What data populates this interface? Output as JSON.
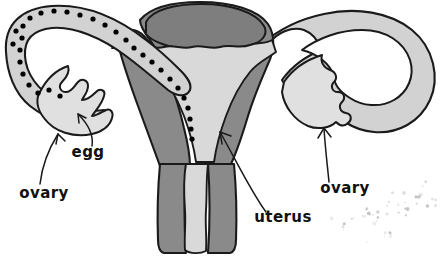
{
  "figure": {
    "title": "Female reproductive system (uterus, fallopian tubes, ovaries)",
    "background_color": "#ffffff",
    "width": 443,
    "height": 259
  },
  "palette": {
    "outline": "#1a1a1a",
    "muscle_dark_gray": "#8a8a8a",
    "dome_gray": "#7e7e7e",
    "cavity_light_gray": "#d9d9d9",
    "tube_light_gray": "#d2d2d2",
    "ovary_pale_gray": "#e0e0e0",
    "egg_dot": "#000000",
    "speckle_gray": "#b0b0b0",
    "label_color": "#111111"
  },
  "labels": [
    {
      "id": "egg",
      "text": "egg",
      "x": 88,
      "y": 157,
      "anchor": "middle",
      "leader": "curved-arrow-up-left"
    },
    {
      "id": "ovary-left",
      "text": "ovary",
      "x": 44,
      "y": 198,
      "anchor": "middle",
      "leader": "curved-arrow-up-right"
    },
    {
      "id": "uterus",
      "text": "uterus",
      "x": 283,
      "y": 222,
      "anchor": "middle",
      "leader": "curved-arrow-up-left"
    },
    {
      "id": "ovary-right",
      "text": "ovary",
      "x": 345,
      "y": 193,
      "anchor": "middle",
      "leader": "curved-arrow-up"
    }
  ],
  "structures": [
    {
      "id": "uterus-body",
      "name": "uterus",
      "fill": "#8a8a8a"
    },
    {
      "id": "uterus-dome",
      "name": "uterine-fundus",
      "fill": "#7e7e7e"
    },
    {
      "id": "uterine-cavity",
      "name": "uterine-cavity",
      "fill": "#d9d9d9"
    },
    {
      "id": "cervix-canal",
      "name": "cervical-canal",
      "fill": "#d9d9d9"
    },
    {
      "id": "fallopian-tube-left",
      "name": "left-fallopian-tube",
      "fill": "#d2d2d2"
    },
    {
      "id": "fallopian-tube-right",
      "name": "right-fallopian-tube",
      "fill": "#d2d2d2"
    },
    {
      "id": "ovary-left-shape",
      "name": "left-ovary",
      "fill": "#e0e0e0"
    },
    {
      "id": "ovary-right-shape",
      "name": "right-ovary",
      "fill": "#e0e0e0"
    }
  ],
  "egg_dots": {
    "description": "black dots tracing the path of an egg from left ovary through the fallopian tube into the uterine cavity",
    "count": 31,
    "radius": 2.6,
    "color": "#000000",
    "points": [
      [
        22,
        38
      ],
      [
        20,
        50
      ],
      [
        20,
        62
      ],
      [
        23,
        74
      ],
      [
        29,
        85
      ],
      [
        38,
        93
      ],
      [
        23,
        26
      ],
      [
        30,
        18
      ],
      [
        41,
        13
      ],
      [
        54,
        11
      ],
      [
        67,
        12
      ],
      [
        80,
        15
      ],
      [
        93,
        19
      ],
      [
        105,
        25
      ],
      [
        116,
        32
      ],
      [
        126,
        40
      ],
      [
        134,
        48
      ],
      [
        143,
        55
      ],
      [
        152,
        62
      ],
      [
        161,
        70
      ],
      [
        170,
        79
      ],
      [
        178,
        88
      ],
      [
        184,
        98
      ],
      [
        188,
        108
      ],
      [
        190,
        119
      ],
      [
        60,
        96
      ],
      [
        191,
        129
      ],
      [
        192,
        139
      ],
      [
        13,
        44
      ],
      [
        16,
        31
      ],
      [
        49,
        90
      ]
    ]
  },
  "speckles": {
    "description": "faint scattered gray specks at lower right (scan artifact)",
    "color": "#b0b0b0",
    "count": 46
  }
}
